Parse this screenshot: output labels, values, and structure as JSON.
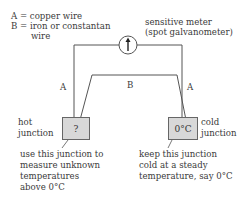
{
  "legend": {
    "line_a": "A = copper wire",
    "line_b1": "B = iron or constantan",
    "line_b2": "wire"
  },
  "meter": {
    "label_line1": "sensitive meter",
    "label_line2": "(spot galvanometer)",
    "icon": "galvanometer-arrow-icon"
  },
  "wires": {
    "left_label": "A",
    "right_label": "A",
    "middle_label": "B"
  },
  "hot_junction": {
    "label_line1": "hot",
    "label_line2": "junction",
    "box_text": "?",
    "note_lines": [
      "use this junction to",
      "measure unknown",
      "temperatures",
      "above 0°C"
    ]
  },
  "cold_junction": {
    "label_line1": "cold",
    "label_line2": "junction",
    "box_text": "0°C",
    "note_lines": [
      "keep this junction",
      "cold at a steady",
      "temperature, say 0°C"
    ]
  },
  "colors": {
    "line": "#555555",
    "box_fill": "#d8d8d8"
  }
}
